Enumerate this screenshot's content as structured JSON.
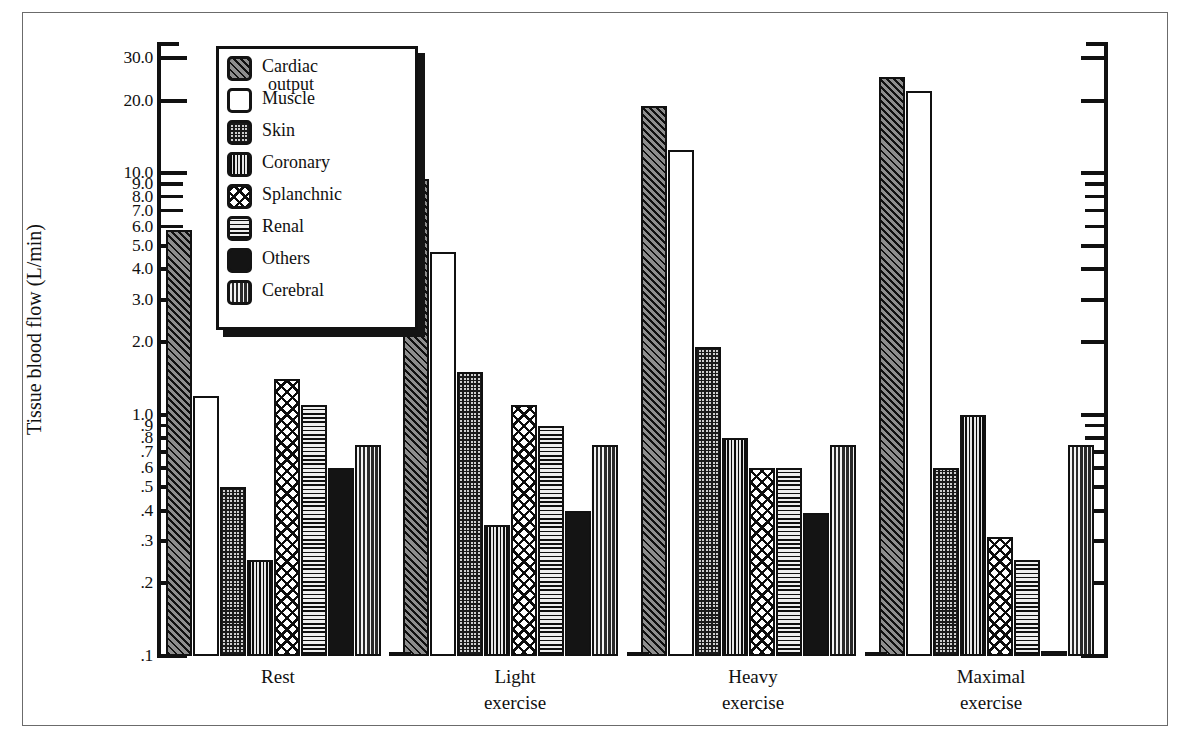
{
  "chart_data": {
    "type": "bar",
    "title": "",
    "xlabel": "",
    "ylabel": "Tissue blood flow (L/min)",
    "yscale": "log",
    "ylim": [
      0.1,
      35.0
    ],
    "grid": false,
    "legend_position": "top-left inside plot",
    "ytick_labels": [
      "30.0",
      "20.0",
      "10.0",
      "9.0",
      "8.0",
      "7.0",
      "6.0",
      "5.0",
      "4.0",
      "3.0",
      "2.0",
      "1.0",
      ".9",
      ".8",
      ".7",
      ".6",
      ".5",
      ".4",
      ".3",
      ".2",
      ".1"
    ],
    "ytick_values": [
      30.0,
      20.0,
      10.0,
      9.0,
      8.0,
      7.0,
      6.0,
      5.0,
      4.0,
      3.0,
      2.0,
      1.0,
      0.9,
      0.8,
      0.7,
      0.6,
      0.5,
      0.4,
      0.3,
      0.2,
      0.1
    ],
    "categories": [
      "Rest",
      "Light exercise",
      "Heavy exercise",
      "Maximal exercise"
    ],
    "category_lines": [
      [
        "Rest",
        ""
      ],
      [
        "Light",
        "exercise"
      ],
      [
        "Heavy",
        "exercise"
      ],
      [
        "Maximal",
        "exercise"
      ]
    ],
    "series": [
      {
        "name": "Cardiac output",
        "pattern": "diagonal-hatch",
        "values": [
          5.8,
          9.5,
          19.0,
          25.0
        ]
      },
      {
        "name": "Muscle",
        "pattern": "white",
        "values": [
          1.2,
          4.7,
          12.5,
          22.0
        ]
      },
      {
        "name": "Skin",
        "pattern": "checker-dots",
        "values": [
          0.5,
          1.5,
          1.9,
          0.6
        ]
      },
      {
        "name": "Coronary",
        "pattern": "vertical-lines",
        "values": [
          0.25,
          0.35,
          0.8,
          1.0
        ]
      },
      {
        "name": "Splanchnic",
        "pattern": "crosshatch",
        "values": [
          1.4,
          1.1,
          0.6,
          0.31
        ]
      },
      {
        "name": "Renal",
        "pattern": "horizontal-lines",
        "values": [
          1.1,
          0.9,
          0.6,
          0.25
        ]
      },
      {
        "name": "Others",
        "pattern": "solid-black",
        "values": [
          0.6,
          0.4,
          0.39,
          0.105
        ]
      },
      {
        "name": "Cerebral",
        "pattern": "wavy",
        "values": [
          0.75,
          0.75,
          0.75,
          0.75
        ]
      }
    ]
  },
  "legend": {
    "items": [
      {
        "label_line1": "Cardiac",
        "label_line2": "output"
      },
      {
        "label_line1": "Muscle",
        "label_line2": ""
      },
      {
        "label_line1": "Skin",
        "label_line2": ""
      },
      {
        "label_line1": "Coronary",
        "label_line2": ""
      },
      {
        "label_line1": "Splanchnic",
        "label_line2": ""
      },
      {
        "label_line1": "Renal",
        "label_line2": ""
      },
      {
        "label_line1": "Others",
        "label_line2": ""
      },
      {
        "label_line1": "Cerebral",
        "label_line2": ""
      }
    ]
  },
  "colors": {
    "ink": "#111111",
    "paper": "#ffffff",
    "frame": "#6b6b6b"
  }
}
